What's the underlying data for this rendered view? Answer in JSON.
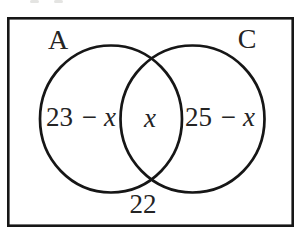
{
  "figure": {
    "type": "venn-diagram",
    "sets": {
      "left": {
        "label": "A"
      },
      "right": {
        "label": "C"
      }
    },
    "regions": {
      "left_only": {
        "number_part": "23 −",
        "variable": "x"
      },
      "intersection": {
        "variable": "x"
      },
      "right_only": {
        "number_part": "25 −",
        "variable": "x"
      },
      "outside": {
        "value": "22"
      }
    },
    "colors": {
      "stroke": "#161616",
      "text": "#242424",
      "background": "#ffffff"
    }
  }
}
